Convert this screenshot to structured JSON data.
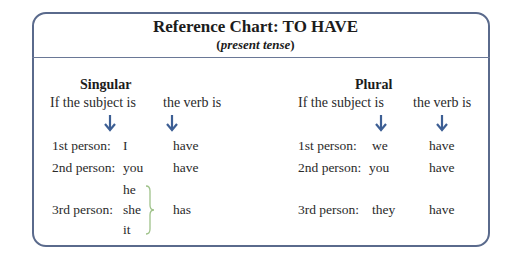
{
  "title": "Reference Chart: TO HAVE",
  "subtitle_open": "(",
  "subtitle_text": "present tense",
  "subtitle_close": ")",
  "colors": {
    "border": "#5a6a8c",
    "arrow": "#3d5f94",
    "brace": "#9fc28a"
  },
  "singular": {
    "heading": "Singular",
    "col_subject": "If the subject is",
    "col_verb": "the verb is",
    "rows": [
      {
        "person": "1st person:",
        "subject": "I",
        "verb": "have"
      },
      {
        "person": "2nd person:",
        "subject": "you",
        "verb": "have"
      },
      {
        "person": "3rd person:",
        "subjects": [
          "he",
          "she",
          "it"
        ],
        "verb": "has"
      }
    ]
  },
  "plural": {
    "heading": "Plural",
    "col_subject": "If the subject is",
    "col_verb": "the verb is",
    "rows": [
      {
        "person": "1st person:",
        "subject": "we",
        "verb": "have"
      },
      {
        "person": "2nd person:",
        "subject": "you",
        "verb": "have"
      },
      {
        "person": "3rd person:",
        "subject": "they",
        "verb": "have"
      }
    ]
  }
}
